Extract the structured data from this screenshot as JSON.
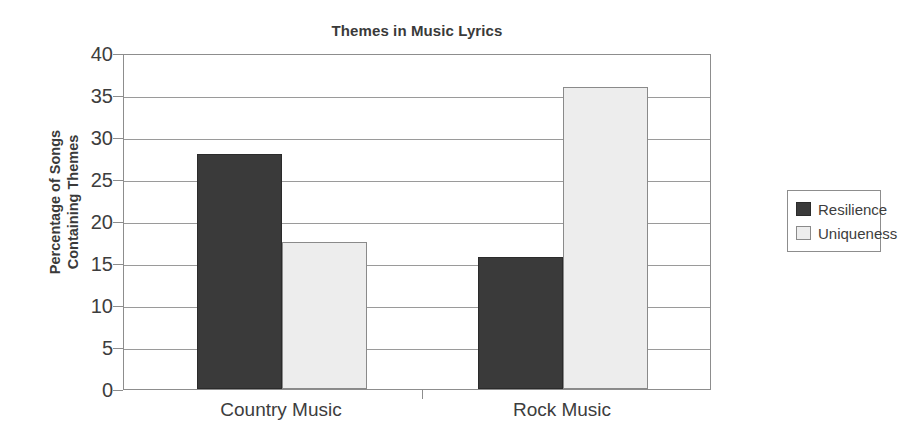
{
  "chart_data": {
    "type": "bar",
    "title": "Themes in Music Lyrics",
    "xlabel": "",
    "ylabel": "Percentage of Songs Containing Themes",
    "ylabel_lines": [
      "Percentage of Songs",
      "Containing Themes"
    ],
    "categories": [
      "Country Music",
      "Rock Music"
    ],
    "series": [
      {
        "name": "Resilience",
        "color": "#3a3a3a",
        "values": [
          28,
          15.7
        ]
      },
      {
        "name": "Uniqueness",
        "color": "#ededed",
        "values": [
          17.5,
          36
        ]
      }
    ],
    "ylim": [
      0,
      40
    ],
    "yticks": [
      0,
      5,
      10,
      15,
      20,
      25,
      30,
      35,
      40
    ],
    "ytick_labels": [
      "0",
      "5",
      "10",
      "15",
      "20",
      "25",
      "30",
      "35",
      "40"
    ],
    "grid": true,
    "legend_position": "right"
  },
  "legend": {
    "entries": [
      {
        "label": "Resilience",
        "swatch": "dark-swatch"
      },
      {
        "label": "Uniqueness",
        "swatch": "light-swatch"
      }
    ]
  }
}
